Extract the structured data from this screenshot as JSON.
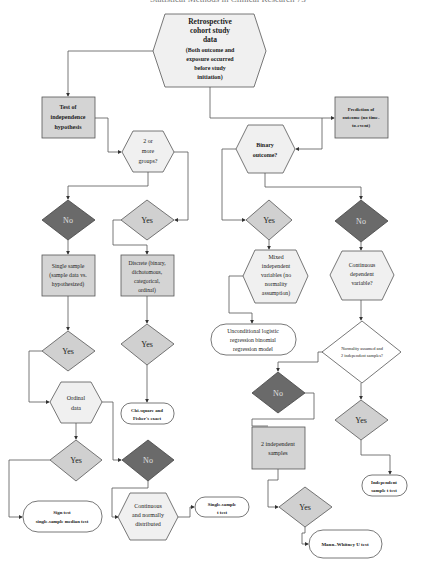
{
  "header": {
    "text": "Statistical Methods in Clinical Research    73"
  },
  "colors": {
    "box_fill": "#d4d4d4",
    "hex_fill": "#f0f0f0",
    "yes_fill": "#d0d0d0",
    "no_fill": "#6a6a6a",
    "stroke": "#555555",
    "terminal_fill": "#ffffff"
  },
  "nodes": {
    "root": {
      "lines": [
        "Retrospective",
        "cohort study",
        "data",
        "(Both outcome and",
        "exposure occurred",
        "before study",
        "initiation)"
      ]
    },
    "test_indep": {
      "lines": [
        "Test of",
        "independence",
        "hypothesis"
      ]
    },
    "two_groups": {
      "lines": [
        "2 or",
        "more",
        "groups?"
      ]
    },
    "prediction": {
      "lines": [
        "Prediction of",
        "outcome (no time-",
        "to-event)"
      ]
    },
    "binary": {
      "lines": [
        "Binary",
        "outcome?"
      ]
    },
    "no_left": {
      "label": "No"
    },
    "yes_groups": {
      "label": "Yes"
    },
    "yes_binary": {
      "label": "Yes"
    },
    "no_binary": {
      "label": "No"
    },
    "single_sample": {
      "lines": [
        "Single sample",
        "(sample data vs.",
        "hypothesized)"
      ]
    },
    "discrete": {
      "lines": [
        "Discrete (binary,",
        "dichotomous,",
        "categorical,",
        "ordinal)"
      ]
    },
    "mixed": {
      "lines": [
        "Mixed",
        "independent",
        "variables (no",
        "normality",
        "assumption)"
      ]
    },
    "continuous_dep": {
      "lines": [
        "Continuous",
        "dependent",
        "variable?"
      ]
    },
    "logistic": {
      "lines": [
        "Unconditional logistic",
        "regression binomial",
        "regression model"
      ]
    },
    "normality": {
      "lines": [
        "Normality assumed and",
        "2 independent samples?"
      ]
    },
    "yes_single": {
      "label": "Yes"
    },
    "yes_discrete": {
      "label": "Yes"
    },
    "ordinal": {
      "lines": [
        "Ordinal",
        "data"
      ]
    },
    "chi_square": {
      "lines": [
        "Chi-square and",
        "Fisher's exact"
      ]
    },
    "no_normality": {
      "label": "No"
    },
    "yes_normality": {
      "label": "Yes"
    },
    "two_indep": {
      "lines": [
        "2 independent",
        "samples"
      ]
    },
    "yes_ordinal": {
      "label": "Yes"
    },
    "no_ordinal": {
      "label": "No"
    },
    "indep_t": {
      "lines": [
        "Independent",
        "sample t test"
      ]
    },
    "sign_test": {
      "lines": [
        "Sign test",
        "single-sample median test"
      ]
    },
    "cont_normal": {
      "lines": [
        "Continuous",
        "and normally",
        "distributed"
      ]
    },
    "single_t": {
      "lines": [
        "Single-sample",
        "t test"
      ]
    },
    "yes_two_indep": {
      "label": "Yes"
    },
    "mann_whitney": {
      "lines": [
        "Mann–Whitney U test"
      ]
    }
  }
}
